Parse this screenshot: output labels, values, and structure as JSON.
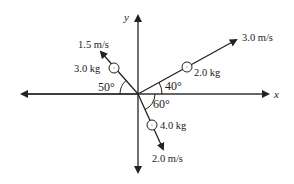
{
  "diagram": {
    "axes": {
      "x_label": "x",
      "y_label": "y"
    },
    "objects": [
      {
        "mass": "3.0 kg",
        "speed": "1.5 m/s",
        "angle": "50°",
        "angle_ref": "negative x-axis",
        "direction": "up-left"
      },
      {
        "mass": "2.0 kg",
        "speed": "3.0 m/s",
        "angle": "40°",
        "angle_ref": "positive x-axis",
        "direction": "up-right"
      },
      {
        "mass": "4.0 kg",
        "speed": "2.0 m/s",
        "angle": "60°",
        "angle_ref": "positive x-axis (below)",
        "direction": "down-right"
      }
    ],
    "colors": {
      "line": "#222222",
      "background": "#ffffff"
    }
  }
}
